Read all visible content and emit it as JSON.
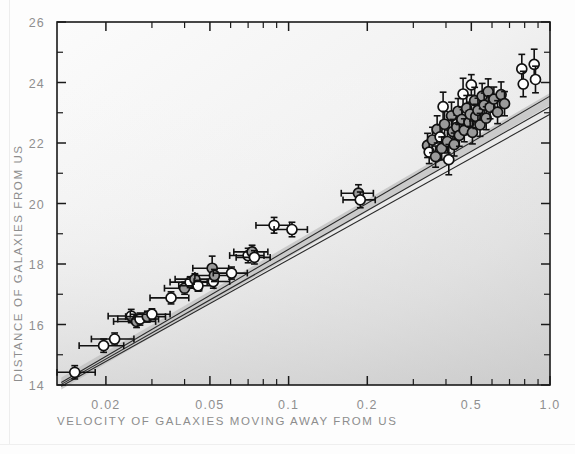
{
  "figure": {
    "name": "hubble-diagram",
    "background_color": "#fdfdfd",
    "plot_bg_light": "#fafafa",
    "plot_bg_dark": "#d2d2d2",
    "axis_color": "#1a1a1a",
    "label_color": "#8d8d8d",
    "marker_fill_gray": "#9a9a9a",
    "marker_fill_white": "#ffffff",
    "marker_stroke": "#111111",
    "fit_band_color": "#bfbfbf",
    "fit_line_color": "#2a2a2a"
  },
  "chart_data": {
    "type": "scatter",
    "title": "",
    "xlabel": "VELOCITY OF GALAXIES MOVING AWAY FROM US",
    "ylabel": "DISTANCE OF GALAXIES FROM US",
    "xscale": "log",
    "yscale": "linear",
    "xlim": [
      0.013,
      1.0
    ],
    "ylim": [
      14,
      26
    ],
    "grid": false,
    "legend": null,
    "xticks_major": [
      0.02,
      0.05,
      0.1,
      0.2,
      0.5,
      1.0
    ],
    "xtick_labels": [
      "0.02",
      "0.05",
      "0.1",
      "0.2",
      "0.5",
      "1.0"
    ],
    "yticks_major": [
      14,
      16,
      18,
      20,
      22,
      24,
      26
    ],
    "ytick_labels": [
      "14",
      "16",
      "18",
      "20",
      "22",
      "24",
      "26"
    ],
    "yticks_minor": [
      15,
      17,
      19,
      21,
      23,
      25
    ],
    "fit_lines": [
      {
        "name": "fit-upper",
        "x0": 0.0135,
        "y0": 14.08,
        "x1": 1.0,
        "y1": 23.55
      },
      {
        "name": "fit-middle",
        "x0": 0.0135,
        "y0": 14.02,
        "x1": 1.0,
        "y1": 23.2
      },
      {
        "name": "fit-lower",
        "x0": 0.0135,
        "y0": 13.96,
        "x1": 1.0,
        "y1": 22.95
      }
    ],
    "fit_band": {
      "name": "confidence-band",
      "x0": 0.0135,
      "y0": 14.05,
      "x1": 1.0,
      "y1": 23.45,
      "half_width": 0.2
    },
    "points": [
      {
        "x": 0.0152,
        "y": 14.42,
        "ey": 0.22,
        "ex": 0.003,
        "fill": "white"
      },
      {
        "x": 0.0196,
        "y": 15.3,
        "ey": 0.22,
        "ex": 0.0038,
        "fill": "white"
      },
      {
        "x": 0.0216,
        "y": 15.52,
        "ey": 0.2,
        "ex": 0.004,
        "fill": "white"
      },
      {
        "x": 0.025,
        "y": 16.28,
        "ey": 0.22,
        "ex": 0.0046,
        "fill": "white"
      },
      {
        "x": 0.0262,
        "y": 16.1,
        "ey": 0.2,
        "ex": 0.0048,
        "fill": "gray"
      },
      {
        "x": 0.027,
        "y": 16.18,
        "ey": 0.2,
        "ex": 0.0048,
        "fill": "white"
      },
      {
        "x": 0.0288,
        "y": 16.26,
        "ey": 0.18,
        "ex": 0.005,
        "fill": "gray"
      },
      {
        "x": 0.03,
        "y": 16.34,
        "ey": 0.18,
        "ex": 0.0052,
        "fill": "white"
      },
      {
        "x": 0.0355,
        "y": 16.88,
        "ey": 0.2,
        "ex": 0.006,
        "fill": "white"
      },
      {
        "x": 0.04,
        "y": 17.2,
        "ey": 0.2,
        "ex": 0.0065,
        "fill": "gray"
      },
      {
        "x": 0.042,
        "y": 17.4,
        "ey": 0.18,
        "ex": 0.0068,
        "fill": "white"
      },
      {
        "x": 0.0438,
        "y": 17.5,
        "ey": 0.18,
        "ex": 0.007,
        "fill": "gray"
      },
      {
        "x": 0.045,
        "y": 17.28,
        "ey": 0.18,
        "ex": 0.007,
        "fill": "white"
      },
      {
        "x": 0.051,
        "y": 17.86,
        "ey": 0.4,
        "ex": 0.008,
        "fill": "gray"
      },
      {
        "x": 0.0515,
        "y": 17.42,
        "ey": 0.22,
        "ex": 0.008,
        "fill": "white"
      },
      {
        "x": 0.052,
        "y": 17.62,
        "ey": 0.2,
        "ex": 0.0082,
        "fill": "gray"
      },
      {
        "x": 0.0605,
        "y": 17.7,
        "ey": 0.2,
        "ex": 0.009,
        "fill": "white"
      },
      {
        "x": 0.07,
        "y": 18.28,
        "ey": 0.24,
        "ex": 0.0105,
        "fill": "white"
      },
      {
        "x": 0.0725,
        "y": 18.4,
        "ey": 0.22,
        "ex": 0.0108,
        "fill": "gray"
      },
      {
        "x": 0.074,
        "y": 18.22,
        "ey": 0.22,
        "ex": 0.011,
        "fill": "white"
      },
      {
        "x": 0.088,
        "y": 19.28,
        "ey": 0.26,
        "ex": 0.013,
        "fill": "white"
      },
      {
        "x": 0.103,
        "y": 19.14,
        "ey": 0.24,
        "ex": 0.015,
        "fill": "white"
      },
      {
        "x": 0.185,
        "y": 20.34,
        "ey": 0.28,
        "ex": 0.026,
        "fill": "gray"
      },
      {
        "x": 0.188,
        "y": 20.12,
        "ey": 0.26,
        "ex": 0.0265,
        "fill": "white"
      },
      {
        "x": 0.34,
        "y": 21.92,
        "ey": 0.4,
        "ex": 0.0,
        "fill": "gray"
      },
      {
        "x": 0.345,
        "y": 21.7,
        "ey": 0.38,
        "ex": 0.0,
        "fill": "white"
      },
      {
        "x": 0.355,
        "y": 22.1,
        "ey": 0.42,
        "ex": 0.0,
        "fill": "gray"
      },
      {
        "x": 0.365,
        "y": 21.55,
        "ey": 0.35,
        "ex": 0.0,
        "fill": "gray"
      },
      {
        "x": 0.37,
        "y": 22.45,
        "ey": 0.45,
        "ex": 0.0,
        "fill": "gray"
      },
      {
        "x": 0.38,
        "y": 22.2,
        "ey": 0.4,
        "ex": 0.0,
        "fill": "white"
      },
      {
        "x": 0.385,
        "y": 21.82,
        "ey": 0.38,
        "ex": 0.0,
        "fill": "gray"
      },
      {
        "x": 0.39,
        "y": 23.2,
        "ey": 0.48,
        "ex": 0.0,
        "fill": "white"
      },
      {
        "x": 0.395,
        "y": 22.62,
        "ey": 0.42,
        "ex": 0.0,
        "fill": "gray"
      },
      {
        "x": 0.405,
        "y": 22.05,
        "ey": 0.38,
        "ex": 0.0,
        "fill": "gray"
      },
      {
        "x": 0.41,
        "y": 21.45,
        "ey": 0.5,
        "ex": 0.0,
        "fill": "white"
      },
      {
        "x": 0.42,
        "y": 22.9,
        "ey": 0.45,
        "ex": 0.0,
        "fill": "gray"
      },
      {
        "x": 0.425,
        "y": 22.38,
        "ey": 0.4,
        "ex": 0.0,
        "fill": "gray"
      },
      {
        "x": 0.43,
        "y": 21.95,
        "ey": 0.38,
        "ex": 0.0,
        "fill": "gray"
      },
      {
        "x": 0.44,
        "y": 22.52,
        "ey": 0.4,
        "ex": 0.0,
        "fill": "gray"
      },
      {
        "x": 0.445,
        "y": 23.05,
        "ey": 0.42,
        "ex": 0.0,
        "fill": "gray"
      },
      {
        "x": 0.45,
        "y": 22.25,
        "ey": 0.36,
        "ex": 0.0,
        "fill": "gray"
      },
      {
        "x": 0.46,
        "y": 22.78,
        "ey": 0.4,
        "ex": 0.0,
        "fill": "gray"
      },
      {
        "x": 0.465,
        "y": 23.62,
        "ey": 0.52,
        "ex": 0.0,
        "fill": "white"
      },
      {
        "x": 0.47,
        "y": 22.42,
        "ey": 0.38,
        "ex": 0.0,
        "fill": "gray"
      },
      {
        "x": 0.48,
        "y": 23.15,
        "ey": 0.42,
        "ex": 0.0,
        "fill": "gray"
      },
      {
        "x": 0.49,
        "y": 22.68,
        "ey": 0.38,
        "ex": 0.0,
        "fill": "gray"
      },
      {
        "x": 0.495,
        "y": 22.95,
        "ey": 0.4,
        "ex": 0.0,
        "fill": "gray"
      },
      {
        "x": 0.5,
        "y": 23.92,
        "ey": 0.34,
        "ex": 0.0,
        "fill": "white"
      },
      {
        "x": 0.505,
        "y": 22.35,
        "ey": 0.38,
        "ex": 0.0,
        "fill": "gray"
      },
      {
        "x": 0.515,
        "y": 23.4,
        "ey": 0.44,
        "ex": 0.0,
        "fill": "gray"
      },
      {
        "x": 0.52,
        "y": 22.88,
        "ey": 0.4,
        "ex": 0.0,
        "fill": "gray"
      },
      {
        "x": 0.53,
        "y": 23.08,
        "ey": 0.4,
        "ex": 0.0,
        "fill": "gray"
      },
      {
        "x": 0.54,
        "y": 22.6,
        "ey": 0.38,
        "ex": 0.0,
        "fill": "gray"
      },
      {
        "x": 0.55,
        "y": 23.55,
        "ey": 0.42,
        "ex": 0.0,
        "fill": "gray"
      },
      {
        "x": 0.56,
        "y": 23.25,
        "ey": 0.4,
        "ex": 0.0,
        "fill": "gray"
      },
      {
        "x": 0.57,
        "y": 22.82,
        "ey": 0.38,
        "ex": 0.0,
        "fill": "gray"
      },
      {
        "x": 0.58,
        "y": 23.7,
        "ey": 0.42,
        "ex": 0.0,
        "fill": "gray"
      },
      {
        "x": 0.59,
        "y": 23.18,
        "ey": 0.38,
        "ex": 0.0,
        "fill": "gray"
      },
      {
        "x": 0.61,
        "y": 23.45,
        "ey": 0.4,
        "ex": 0.0,
        "fill": "gray"
      },
      {
        "x": 0.63,
        "y": 23.02,
        "ey": 0.38,
        "ex": 0.0,
        "fill": "gray"
      },
      {
        "x": 0.65,
        "y": 23.6,
        "ey": 0.42,
        "ex": 0.0,
        "fill": "gray"
      },
      {
        "x": 0.67,
        "y": 23.3,
        "ey": 0.4,
        "ex": 0.0,
        "fill": "gray"
      },
      {
        "x": 0.78,
        "y": 24.45,
        "ey": 0.48,
        "ex": 0.0,
        "fill": "white"
      },
      {
        "x": 0.79,
        "y": 23.95,
        "ey": 0.42,
        "ex": 0.0,
        "fill": "white"
      },
      {
        "x": 0.87,
        "y": 24.6,
        "ey": 0.5,
        "ex": 0.0,
        "fill": "white"
      },
      {
        "x": 0.88,
        "y": 24.1,
        "ey": 0.44,
        "ex": 0.0,
        "fill": "white"
      }
    ]
  }
}
